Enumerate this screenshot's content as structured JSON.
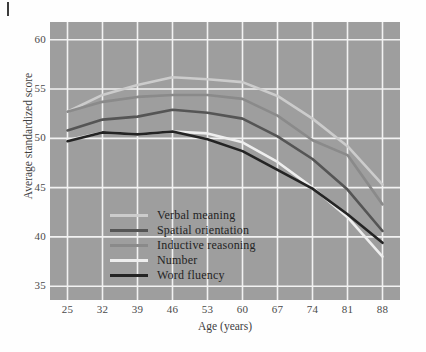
{
  "figure": {
    "background_color": "#fefefe",
    "plot_background_color": "#9e9e9e",
    "grid_color": "#f2f2f2"
  },
  "chart_data": {
    "type": "line",
    "title": "",
    "subtitle": "",
    "xlabel": "Age (years)",
    "ylabel": "Average standardized score",
    "x": [
      25,
      32,
      39,
      46,
      53,
      60,
      67,
      74,
      81,
      88
    ],
    "xticklabels": [
      "25",
      "32",
      "39",
      "46",
      "53",
      "60",
      "67",
      "74",
      "81",
      "88"
    ],
    "yticklabels": [
      "35",
      "40",
      "45",
      "50",
      "55",
      "60"
    ],
    "yticks": [
      35,
      40,
      45,
      50,
      55,
      60
    ],
    "xlim": [
      21.5,
      91.5
    ],
    "ylim": [
      33.6,
      61.8
    ],
    "grid": true,
    "legend_position": "lower left inside axes",
    "series": [
      {
        "name": "Verbal meaning",
        "color": "#cccccc",
        "values": [
          52.7,
          54.4,
          55.4,
          56.2,
          56.0,
          55.7,
          54.3,
          52.0,
          49.2,
          45.3
        ]
      },
      {
        "name": "Spatial orientation",
        "color": "#555555",
        "values": [
          50.8,
          51.9,
          52.2,
          52.9,
          52.6,
          52.0,
          50.2,
          47.9,
          44.8,
          40.6
        ]
      },
      {
        "name": "Inductive reasoning",
        "color": "#8a8a8a",
        "values": [
          52.7,
          53.7,
          54.2,
          54.4,
          54.4,
          54.0,
          52.3,
          49.8,
          48.3,
          43.3
        ]
      },
      {
        "name": "Number",
        "color": "#eeeeee",
        "values": [
          49.8,
          50.6,
          50.4,
          50.7,
          50.5,
          49.6,
          47.6,
          45.0,
          42.0,
          38.0
        ]
      },
      {
        "name": "Word fluency",
        "color": "#242424",
        "values": [
          49.7,
          50.6,
          50.4,
          50.7,
          49.9,
          48.7,
          46.8,
          44.9,
          42.3,
          39.4
        ]
      }
    ]
  },
  "legend": {
    "items": [
      {
        "label": "Verbal meaning"
      },
      {
        "label": "Spatial orientation"
      },
      {
        "label": "Inductive reasoning"
      },
      {
        "label": "Number"
      },
      {
        "label": "Word fluency"
      }
    ]
  }
}
